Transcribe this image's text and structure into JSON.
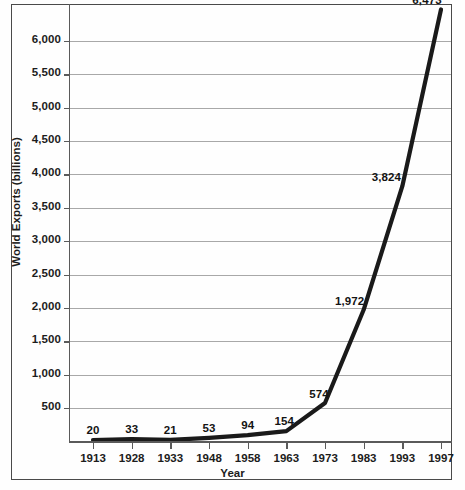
{
  "chart_data": {
    "type": "line",
    "title": "",
    "xlabel": "Year",
    "ylabel": "World Exports (billions)",
    "categories": [
      "1913",
      "1928",
      "1933",
      "1948",
      "1958",
      "1963",
      "1973",
      "1983",
      "1993",
      "1997"
    ],
    "values": [
      20,
      33,
      21,
      53,
      94,
      154,
      574,
      1972,
      3824,
      6473
    ],
    "point_labels": [
      "20",
      "33",
      "21",
      "53",
      "94",
      "154",
      "574",
      "1,972",
      "3,824",
      "6,473"
    ],
    "ytick_labels": [
      "6,000",
      "5,500",
      "5,000",
      "4,500",
      "4,000",
      "3,500",
      "3,000",
      "2,500",
      "2,000",
      "1,500",
      "1,000",
      "500"
    ],
    "ytick_values": [
      6000,
      5500,
      5000,
      4500,
      4000,
      3500,
      3000,
      2500,
      2000,
      1500,
      1000,
      500
    ],
    "ylim": [
      0,
      6600
    ],
    "xlim_labels": [
      "1913",
      "1997"
    ],
    "grid": "horizontal",
    "legend": "none",
    "series_color": "#1a1a1a",
    "gridline_color": "#a8a8a8",
    "frame_color": "#4a4a4a",
    "background_color": "#ffffff"
  }
}
